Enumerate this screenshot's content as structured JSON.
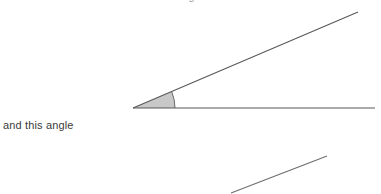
{
  "figure": {
    "caption_left": "and this angle",
    "clipped_top_text": "measure of this angle",
    "stroke_color": "#595959",
    "sector_fill_color": "#c8c8c8",
    "sector_stroke_color": "#6b6b6b",
    "text_color": "#3b3b3b",
    "background_color": "#ffffff",
    "vertex": {
      "x": 133,
      "y": 108
    },
    "rays": [
      {
        "name": "horizontal-ray",
        "x1": 133,
        "y1": 108,
        "x2": 375,
        "y2": 108
      },
      {
        "name": "upper-ray",
        "x1": 133,
        "y1": 108,
        "x2": 358,
        "y2": 12
      }
    ],
    "angle_sector": {
      "radius": 42,
      "start_angle_deg": 0,
      "end_angle_deg": 23,
      "arc_start": {
        "x": 175,
        "y": 108
      },
      "arc_end": {
        "x": 172,
        "y": 91
      }
    },
    "lower_segment": {
      "name": "lower-line-segment",
      "x1": 231,
      "y1": 193,
      "x2": 327,
      "y2": 156
    }
  }
}
